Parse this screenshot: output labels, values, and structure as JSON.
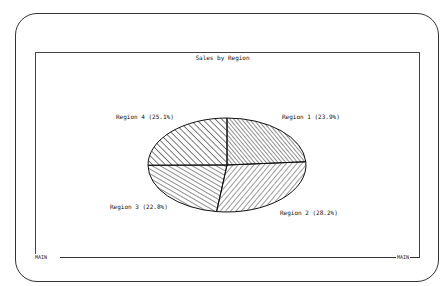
{
  "chart_data": {
    "type": "pie",
    "title": "Sales by Region",
    "categories": [
      "Region 1",
      "Region 2",
      "Region 3",
      "Region 4"
    ],
    "values": [
      23.9,
      28.2,
      22.8,
      25.1
    ],
    "labels": [
      "Region 1 (23.9%)",
      "Region 2 (28.2%)",
      "Region 3 (22.8%)",
      "Region 4 (25.1%)"
    ],
    "start_angle": "top, clockwise",
    "fill": "hatched, black lines on white",
    "legend": "none (direct labels)"
  },
  "frame": {
    "left_tag": "MAIN",
    "right_tag": "MAIN"
  }
}
